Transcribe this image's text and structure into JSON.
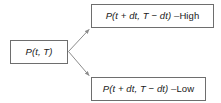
{
  "diagram": {
    "type": "binomial-tree",
    "background_color": "#ffffff",
    "node_border_color": "#6e6e6e",
    "edge_color": "#8c8c8c",
    "text_color": "#1a1a1a",
    "nodes": {
      "source": {
        "text": "P(t, T)",
        "math": "P(t, T)",
        "suffix": ""
      },
      "high": {
        "text": "P(t + dt, T − dt) – High",
        "math": "P(t + dt, T − dt) – ",
        "suffix": "High"
      },
      "low": {
        "text": "P(t + dt, T − dt) – Low",
        "math": "P(t + dt, T − dt) – ",
        "suffix": "Low"
      }
    },
    "edges": [
      {
        "from": "source",
        "to": "high",
        "label": ""
      },
      {
        "from": "source",
        "to": "low",
        "label": ""
      }
    ]
  }
}
